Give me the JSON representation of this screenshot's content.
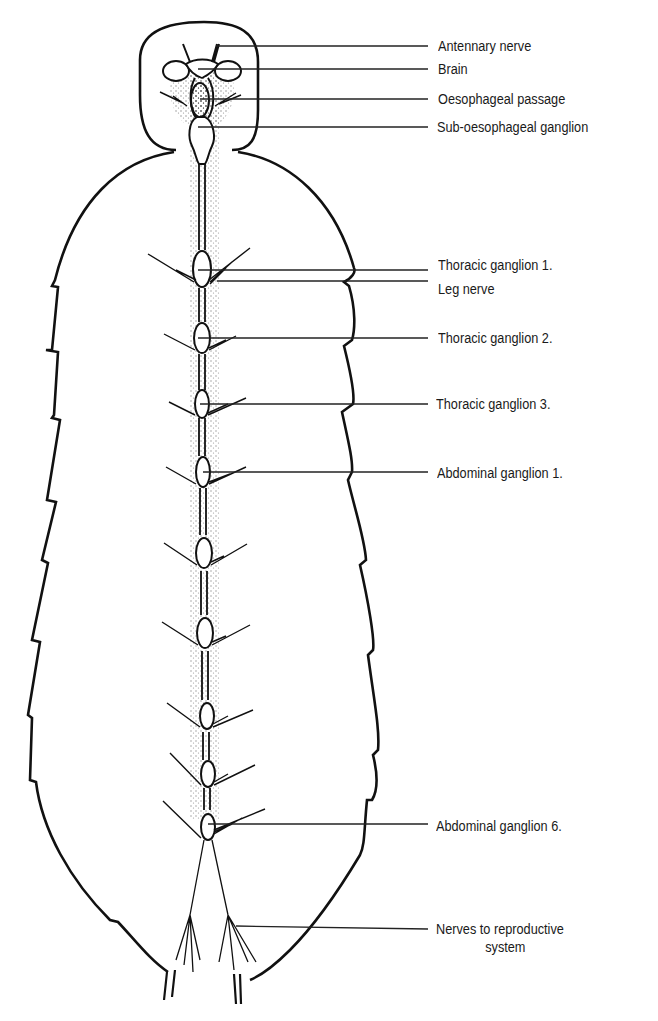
{
  "diagram": {
    "colors": {
      "ink": "#1a1a1a",
      "background": "#ffffff"
    },
    "labels": [
      {
        "id": "antennary-nerve",
        "text": "Antennary nerve",
        "y": 46
      },
      {
        "id": "brain",
        "text": "Brain",
        "y": 69
      },
      {
        "id": "oesophageal-passage",
        "text": "Oesophageal passage",
        "y": 99
      },
      {
        "id": "sub-oesophageal-ganglion",
        "text": "Sub-oesophageal ganglion",
        "y": 127
      },
      {
        "id": "thoracic-ganglion-1",
        "text": "Thoracic ganglion 1.",
        "y": 270
      },
      {
        "id": "leg-nerve",
        "text": "Leg nerve",
        "y": 292
      },
      {
        "id": "thoracic-ganglion-2",
        "text": "Thoracic ganglion 2.",
        "y": 338
      },
      {
        "id": "thoracic-ganglion-3",
        "text": "Thoracic ganglion 3.",
        "y": 404
      },
      {
        "id": "abdominal-ganglion-1",
        "text": "Abdominal ganglion 1.",
        "y": 472
      },
      {
        "id": "abdominal-ganglion-6",
        "text": "Abdominal ganglion 6.",
        "y": 826
      },
      {
        "id": "nerves-to-reproductive-system",
        "text": "Nerves to reproductive",
        "text2": "system",
        "y": 929
      }
    ],
    "ganglia_y": [
      270,
      338,
      404,
      472,
      553,
      633,
      716,
      774,
      826
    ]
  }
}
